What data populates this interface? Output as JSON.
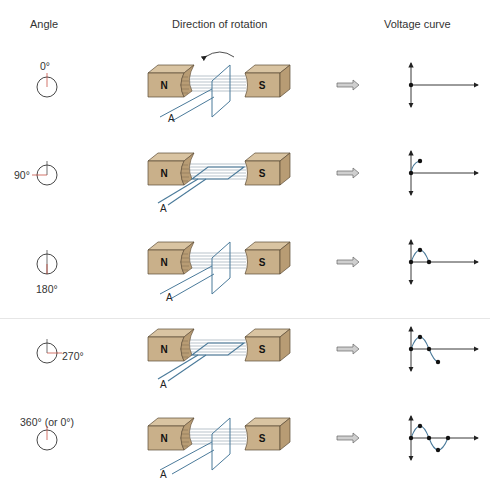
{
  "headers": {
    "angle": "Angle",
    "rotation": "Direction of rotation",
    "voltage": "Voltage curve"
  },
  "rows": [
    {
      "angle_label": "0°",
      "loop_state": "vertical",
      "curve_points": 1
    },
    {
      "angle_label": "90°",
      "loop_state": "horizontal",
      "curve_points": 2
    },
    {
      "angle_label": "180°",
      "loop_state": "vertical",
      "curve_points": 3
    },
    {
      "angle_label": "270°",
      "loop_state": "horizontal",
      "curve_points": 4
    },
    {
      "angle_label": "360° (or 0°)",
      "loop_state": "vertical",
      "curve_points": 5
    }
  ],
  "magnets": {
    "north": "N",
    "south": "S"
  },
  "loop_label": "A",
  "colors": {
    "magnet_face": "#c9b08a",
    "magnet_top": "#d9c4a2",
    "magnet_side": "#b89c74",
    "loop": "#4a7a9a",
    "field_lines": "#8a9aa8",
    "angle_marker": "#c0392b",
    "arrow_fill": "#cfcfcf"
  }
}
